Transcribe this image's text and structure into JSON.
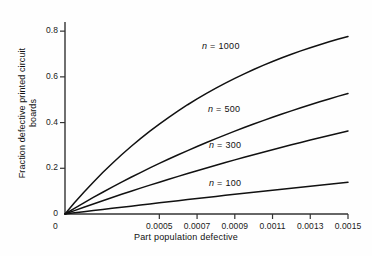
{
  "figure": {
    "width": 372,
    "height": 256,
    "background": "#fefefe",
    "line_color": "#111111",
    "axis_color": "#333333"
  },
  "chart_data": {
    "type": "line",
    "title": "",
    "xlabel": "Part population defective",
    "ylabel_line1": "Fraction defective printed circuit",
    "ylabel_line2": "boards",
    "xlim": [
      0,
      0.0015
    ],
    "ylim": [
      0,
      0.84
    ],
    "grid": false,
    "legend": "inline-annotations",
    "xticks": [
      0.0005,
      0.0007,
      0.0009,
      0.0011,
      0.0013,
      0.0015
    ],
    "xtick_labels": [
      "0.0005",
      "0.0007",
      "0.0009",
      "0.0011",
      "0.0013",
      "0.0015"
    ],
    "yticks": [
      0,
      0.2,
      0.4,
      0.6,
      0.8
    ],
    "ytick_labels": [
      "0",
      "0.2",
      "0.4",
      "0.6",
      "0.8"
    ],
    "x_origin_label": "0",
    "formula": "1 - (1 - p)^n",
    "x": [
      0,
      5e-05,
      0.0001,
      0.00015,
      0.0002,
      0.00025,
      0.0003,
      0.00035,
      0.0004,
      0.00045,
      0.0005,
      0.00055,
      0.0006,
      0.00065,
      0.0007,
      0.00075,
      0.0008,
      0.00085,
      0.0009,
      0.00095,
      0.001,
      0.00105,
      0.0011,
      0.00115,
      0.0012,
      0.00125,
      0.0013,
      0.00135,
      0.0014,
      0.00145,
      0.0015
    ],
    "series": [
      {
        "name": "n = 1000",
        "n": 1000,
        "label": "n = 1000",
        "label_italic_part": "n",
        "values": [
          0,
          0.0488,
          0.0952,
          0.1393,
          0.1813,
          0.2212,
          0.2592,
          0.2953,
          0.3297,
          0.3624,
          0.3935,
          0.4231,
          0.4512,
          0.478,
          0.5034,
          0.5277,
          0.5507,
          0.5726,
          0.5934,
          0.6133,
          0.6322,
          0.6501,
          0.6672,
          0.6835,
          0.6989,
          0.7136,
          0.7275,
          0.7408,
          0.7534,
          0.7654,
          0.7769
        ]
      },
      {
        "name": "n = 500",
        "n": 500,
        "label": "n = 500",
        "label_italic_part": "n",
        "values": [
          0,
          0.0247,
          0.0488,
          0.0723,
          0.0952,
          0.1175,
          0.1393,
          0.1606,
          0.1813,
          0.2015,
          0.2212,
          0.2404,
          0.2592,
          0.2775,
          0.2953,
          0.3127,
          0.3297,
          0.3463,
          0.3624,
          0.3782,
          0.3935,
          0.4085,
          0.4231,
          0.4374,
          0.4512,
          0.4648,
          0.478,
          0.4909,
          0.5034,
          0.5157,
          0.5276
        ]
      },
      {
        "name": "n = 300",
        "n": 300,
        "label": "n = 300",
        "label_italic_part": "n",
        "values": [
          0,
          0.0149,
          0.0296,
          0.044,
          0.0583,
          0.0723,
          0.0861,
          0.0997,
          0.1131,
          0.1263,
          0.1393,
          0.1521,
          0.1647,
          0.1772,
          0.1894,
          0.2015,
          0.2134,
          0.2252,
          0.2367,
          0.2481,
          0.2593,
          0.2704,
          0.2813,
          0.292,
          0.3026,
          0.3131,
          0.3234,
          0.3335,
          0.3435,
          0.3534,
          0.3631
        ]
      },
      {
        "name": "n = 100",
        "n": 100,
        "label": "n = 100",
        "label_italic_part": "n",
        "values": [
          0,
          0.005,
          0.01,
          0.0149,
          0.0198,
          0.0247,
          0.0296,
          0.0344,
          0.0392,
          0.044,
          0.0488,
          0.0535,
          0.0583,
          0.063,
          0.0676,
          0.0723,
          0.0769,
          0.0815,
          0.0861,
          0.0906,
          0.0952,
          0.0997,
          0.1041,
          0.1086,
          0.113,
          0.1174,
          0.1218,
          0.1262,
          0.1305,
          0.1348,
          0.1391
        ]
      }
    ],
    "annotations": [
      {
        "text": "n = 1000",
        "x_px": 202,
        "y_px": 41
      },
      {
        "text": "n = 500",
        "x_px": 208,
        "y_px": 104
      },
      {
        "text": "n = 300",
        "x_px": 209,
        "y_px": 140
      },
      {
        "text": "n = 100",
        "x_px": 209,
        "y_px": 178
      }
    ]
  }
}
